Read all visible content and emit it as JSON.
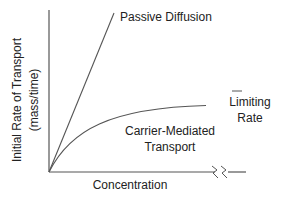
{
  "diagram": {
    "type": "transport-kinetics",
    "y_axis_label_line1": "Initial Rate of Transport",
    "y_axis_label_line2": "(mass/time)",
    "x_axis_label": "Concentration",
    "curves": [
      {
        "name": "passive-diffusion",
        "label": "Passive Diffusion",
        "shape": "linear"
      },
      {
        "name": "carrier-mediated",
        "label_line1": "Carrier-Mediated",
        "label_line2": "Transport",
        "shape": "saturating"
      }
    ],
    "asymptote_label_line1": "Limiting",
    "asymptote_label_line2": "Rate",
    "axis_break": "double-zigzag",
    "colors": {
      "line": "#555555",
      "text": "#222222"
    }
  }
}
